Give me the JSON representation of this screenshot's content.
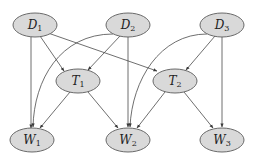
{
  "diagram": {
    "type": "directed-graph",
    "colors": {
      "node_fill": "#d9d9d9",
      "node_stroke": "#5a5a5a",
      "edge": "#4a4a4a"
    },
    "nodes": [
      {
        "id": "D1",
        "base": "D",
        "sub": "1",
        "cx": 35,
        "cy": 25
      },
      {
        "id": "D2",
        "base": "D",
        "sub": "2",
        "cx": 128,
        "cy": 25
      },
      {
        "id": "D3",
        "base": "D",
        "sub": "3",
        "cx": 222,
        "cy": 25
      },
      {
        "id": "T1",
        "base": "T",
        "sub": "1",
        "cx": 78,
        "cy": 81
      },
      {
        "id": "T2",
        "base": "T",
        "sub": "2",
        "cx": 175,
        "cy": 81
      },
      {
        "id": "W1",
        "base": "W",
        "sub": "1",
        "cx": 32,
        "cy": 140
      },
      {
        "id": "W2",
        "base": "W",
        "sub": "2",
        "cx": 128,
        "cy": 140
      },
      {
        "id": "W3",
        "base": "W",
        "sub": "3",
        "cx": 222,
        "cy": 140
      }
    ],
    "edges": [
      {
        "from": "D1",
        "to": "W1"
      },
      {
        "from": "D1",
        "to": "T1"
      },
      {
        "from": "D1",
        "to": "T2"
      },
      {
        "from": "D2",
        "to": "T1"
      },
      {
        "from": "D2",
        "to": "W2"
      },
      {
        "from": "D2",
        "to": "W1",
        "curved": true
      },
      {
        "from": "D3",
        "to": "T2"
      },
      {
        "from": "D3",
        "to": "W3"
      },
      {
        "from": "D3",
        "to": "W2",
        "curved": true
      },
      {
        "from": "T1",
        "to": "W1"
      },
      {
        "from": "T1",
        "to": "W2"
      },
      {
        "from": "T2",
        "to": "W2"
      },
      {
        "from": "T2",
        "to": "W3"
      }
    ]
  }
}
